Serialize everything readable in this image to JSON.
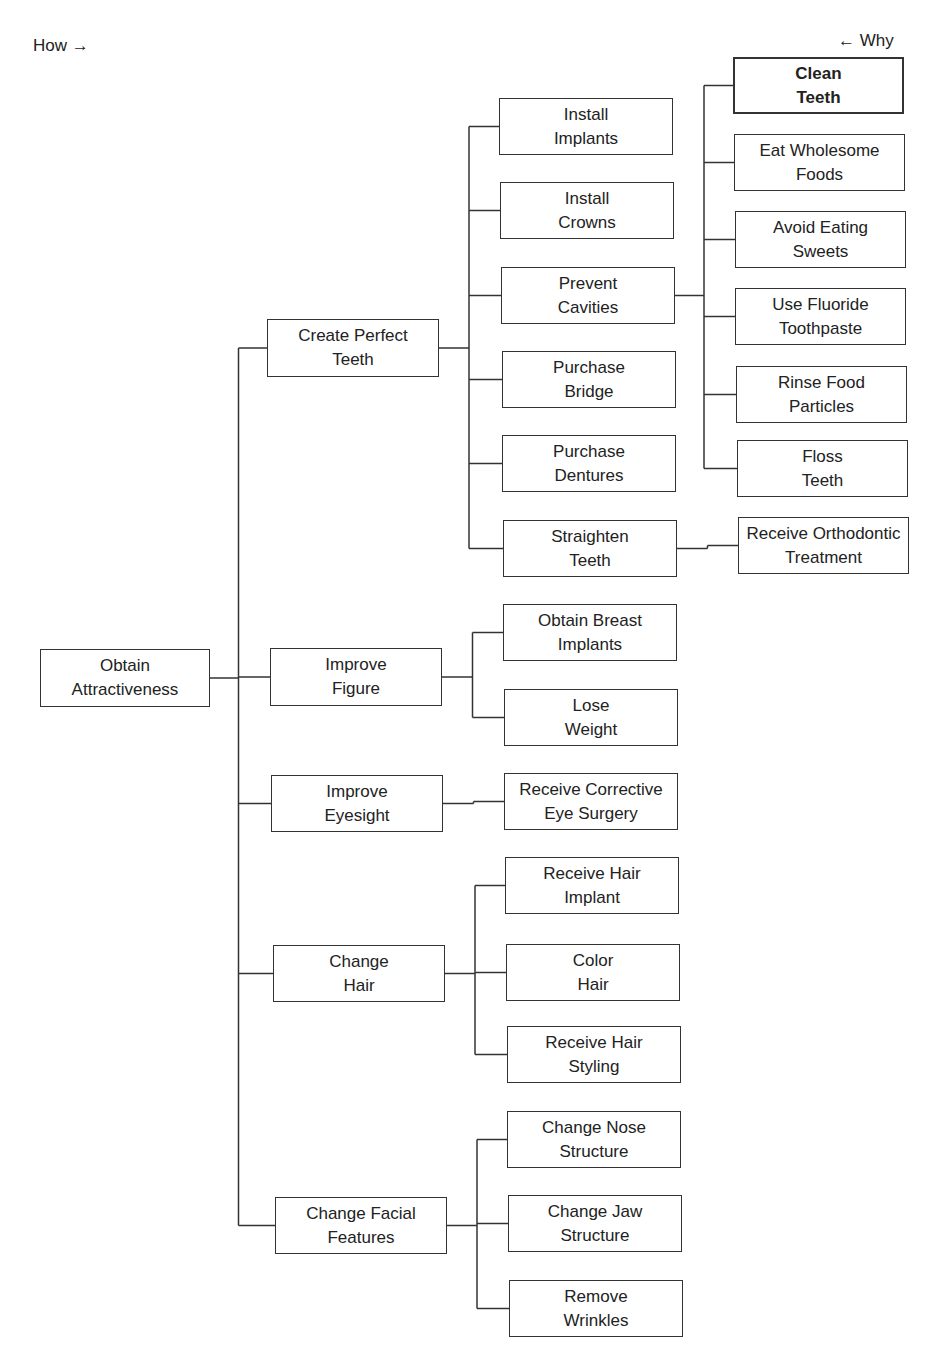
{
  "legend": {
    "how": "How →",
    "why": "← Why"
  },
  "nodes": [
    {
      "id": "obtain-attractiveness",
      "label": "Obtain\nAttractiveness",
      "x": 40,
      "y": 649,
      "w": 170,
      "h": 58
    },
    {
      "id": "create-perfect-teeth",
      "label": "Create Perfect\nTeeth",
      "x": 267,
      "y": 319,
      "w": 172,
      "h": 58
    },
    {
      "id": "improve-figure",
      "label": "Improve\nFigure",
      "x": 270,
      "y": 648,
      "w": 172,
      "h": 58
    },
    {
      "id": "improve-eyesight",
      "label": "Improve\nEyesight",
      "x": 271,
      "y": 775,
      "w": 172,
      "h": 57
    },
    {
      "id": "change-hair",
      "label": "Change\nHair",
      "x": 273,
      "y": 945,
      "w": 172,
      "h": 57
    },
    {
      "id": "change-facial-features",
      "label": "Change Facial\nFeatures",
      "x": 275,
      "y": 1197,
      "w": 172,
      "h": 57
    },
    {
      "id": "install-implants",
      "label": "Install\nImplants",
      "x": 499,
      "y": 98,
      "w": 174,
      "h": 57
    },
    {
      "id": "install-crowns",
      "label": "Install\nCrowns",
      "x": 500,
      "y": 182,
      "w": 174,
      "h": 57
    },
    {
      "id": "prevent-cavities",
      "label": "Prevent\nCavities",
      "x": 501,
      "y": 267,
      "w": 174,
      "h": 57
    },
    {
      "id": "purchase-bridge",
      "label": "Purchase\nBridge",
      "x": 502,
      "y": 351,
      "w": 174,
      "h": 57
    },
    {
      "id": "purchase-dentures",
      "label": "Purchase\nDentures",
      "x": 502,
      "y": 435,
      "w": 174,
      "h": 57
    },
    {
      "id": "straighten-teeth",
      "label": "Straighten\nTeeth",
      "x": 503,
      "y": 520,
      "w": 174,
      "h": 57
    },
    {
      "id": "obtain-breast-implants",
      "label": "Obtain Breast\nImplants",
      "x": 503,
      "y": 604,
      "w": 174,
      "h": 57
    },
    {
      "id": "lose-weight",
      "label": "Lose\nWeight",
      "x": 504,
      "y": 689,
      "w": 174,
      "h": 57
    },
    {
      "id": "receive-corrective-eye-surgery",
      "label": "Receive Corrective\nEye Surgery",
      "x": 504,
      "y": 773,
      "w": 174,
      "h": 57
    },
    {
      "id": "receive-hair-implant",
      "label": "Receive Hair\nImplant",
      "x": 505,
      "y": 857,
      "w": 174,
      "h": 57
    },
    {
      "id": "color-hair",
      "label": "Color\nHair",
      "x": 506,
      "y": 944,
      "w": 174,
      "h": 57
    },
    {
      "id": "receive-hair-styling",
      "label": "Receive Hair\nStyling",
      "x": 507,
      "y": 1026,
      "w": 174,
      "h": 57
    },
    {
      "id": "change-nose-structure",
      "label": "Change Nose\nStructure",
      "x": 507,
      "y": 1111,
      "w": 174,
      "h": 57
    },
    {
      "id": "change-jaw-structure",
      "label": "Change Jaw\nStructure",
      "x": 508,
      "y": 1195,
      "w": 174,
      "h": 57
    },
    {
      "id": "remove-wrinkles",
      "label": "Remove\nWrinkles",
      "x": 509,
      "y": 1280,
      "w": 174,
      "h": 57
    },
    {
      "id": "clean-teeth",
      "label": "Clean\nTeeth",
      "x": 733,
      "y": 57,
      "w": 171,
      "h": 57,
      "bold": true
    },
    {
      "id": "eat-wholesome-foods",
      "label": "Eat Wholesome\nFoods",
      "x": 734,
      "y": 134,
      "w": 171,
      "h": 57
    },
    {
      "id": "avoid-eating-sweets",
      "label": "Avoid Eating\nSweets",
      "x": 735,
      "y": 211,
      "w": 171,
      "h": 57
    },
    {
      "id": "use-fluoride-toothpaste",
      "label": "Use Fluoride\nToothpaste",
      "x": 735,
      "y": 288,
      "w": 171,
      "h": 57
    },
    {
      "id": "rinse-food-particles",
      "label": "Rinse Food\nParticles",
      "x": 736,
      "y": 366,
      "w": 171,
      "h": 57
    },
    {
      "id": "floss-teeth",
      "label": "Floss\nTeeth",
      "x": 737,
      "y": 440,
      "w": 171,
      "h": 57
    },
    {
      "id": "receive-orthodontic-treatment",
      "label": "Receive Orthodontic\nTreatment",
      "x": 738,
      "y": 517,
      "w": 171,
      "h": 57
    }
  ],
  "edges": [
    [
      "obtain-attractiveness",
      "create-perfect-teeth"
    ],
    [
      "obtain-attractiveness",
      "improve-figure"
    ],
    [
      "obtain-attractiveness",
      "improve-eyesight"
    ],
    [
      "obtain-attractiveness",
      "change-hair"
    ],
    [
      "obtain-attractiveness",
      "change-facial-features"
    ],
    [
      "create-perfect-teeth",
      "install-implants"
    ],
    [
      "create-perfect-teeth",
      "install-crowns"
    ],
    [
      "create-perfect-teeth",
      "prevent-cavities"
    ],
    [
      "create-perfect-teeth",
      "purchase-bridge"
    ],
    [
      "create-perfect-teeth",
      "purchase-dentures"
    ],
    [
      "create-perfect-teeth",
      "straighten-teeth"
    ],
    [
      "prevent-cavities",
      "clean-teeth"
    ],
    [
      "prevent-cavities",
      "eat-wholesome-foods"
    ],
    [
      "prevent-cavities",
      "avoid-eating-sweets"
    ],
    [
      "prevent-cavities",
      "use-fluoride-toothpaste"
    ],
    [
      "prevent-cavities",
      "rinse-food-particles"
    ],
    [
      "prevent-cavities",
      "floss-teeth"
    ],
    [
      "straighten-teeth",
      "receive-orthodontic-treatment"
    ],
    [
      "improve-figure",
      "obtain-breast-implants"
    ],
    [
      "improve-figure",
      "lose-weight"
    ],
    [
      "improve-eyesight",
      "receive-corrective-eye-surgery"
    ],
    [
      "change-hair",
      "receive-hair-implant"
    ],
    [
      "change-hair",
      "color-hair"
    ],
    [
      "change-hair",
      "receive-hair-styling"
    ],
    [
      "change-facial-features",
      "change-nose-structure"
    ],
    [
      "change-facial-features",
      "change-jaw-structure"
    ],
    [
      "change-facial-features",
      "remove-wrinkles"
    ]
  ]
}
